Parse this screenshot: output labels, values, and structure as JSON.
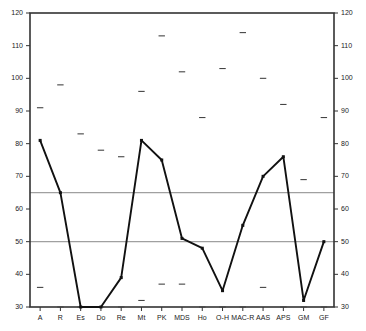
{
  "chart_data": {
    "type": "line",
    "title": "",
    "subtitle": "",
    "xlabel": "",
    "ylabel": "",
    "ylim": [
      30,
      120
    ],
    "ytick_values": [
      30,
      40,
      50,
      60,
      70,
      80,
      90,
      100,
      110,
      120
    ],
    "ytick_labels_left": [
      "30",
      "40",
      "50",
      "60",
      "70",
      "80",
      "90",
      "100",
      "110",
      "120"
    ],
    "ytick_labels_right": [
      "30",
      "40",
      "50",
      "60",
      "70",
      "80",
      "90",
      "100",
      "110",
      "120"
    ],
    "grid": false,
    "reference_lines": [
      {
        "value": 65,
        "color": "#a0a0a0"
      },
      {
        "value": 50,
        "color": "#a0a0a0"
      }
    ],
    "legend": [],
    "legend_position": "none",
    "categories": [
      "A",
      "R",
      "Es",
      "Do",
      "Re",
      "Mt",
      "PK",
      "MDS",
      "Ho",
      "O-H",
      "MAC-R",
      "AAS",
      "APS",
      "GM",
      "GF"
    ],
    "series": [
      {
        "name": "profile-line",
        "marker": "square",
        "color": "#111111",
        "values": [
          81,
          65,
          30,
          30,
          39,
          81,
          75,
          51,
          48,
          35,
          55,
          70,
          76,
          32,
          50
        ]
      },
      {
        "name": "upper-dash-markers",
        "marker": "dash",
        "color": "#444444",
        "values": [
          91,
          98,
          83,
          78,
          76,
          96,
          113,
          102,
          88,
          103,
          114,
          100,
          92,
          69,
          88
        ]
      },
      {
        "name": "lower-dash-markers",
        "marker": "dash",
        "color": "#444444",
        "values": [
          36,
          30,
          30,
          30,
          30,
          32,
          37,
          37,
          30,
          30,
          30,
          36,
          30,
          30,
          30
        ]
      }
    ]
  },
  "axes": {
    "frame_color": "#333333",
    "tick_color": "#333333",
    "label_color": "#1a1a1a"
  }
}
